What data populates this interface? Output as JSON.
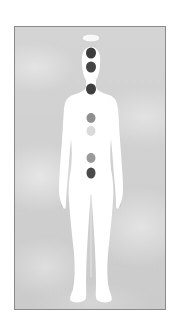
{
  "image": {
    "description": "Chakra diagram: white human silhouette on grey cloudy background with seven chakra points along the spine",
    "card_border_color": "#8a8a8a",
    "background_color": "#d0d0d0",
    "figure_color": "#ffffff"
  },
  "chakras": [
    {
      "name": "crown",
      "shape": "halo",
      "x": 76,
      "y": 11,
      "w": 18,
      "h": 8,
      "color": "#f8f8f8",
      "stroke": "#cfcfcf"
    },
    {
      "name": "third-eye",
      "shape": "dot",
      "x": 76,
      "y": 26,
      "w": 10,
      "h": 11,
      "color": "#3c3c3c"
    },
    {
      "name": "throat-upper",
      "shape": "dot",
      "x": 76,
      "y": 40,
      "w": 10,
      "h": 11,
      "color": "#444444"
    },
    {
      "name": "throat",
      "shape": "dot",
      "x": 76,
      "y": 62,
      "w": 10,
      "h": 11,
      "color": "#3e3e3e"
    },
    {
      "name": "heart",
      "shape": "dot",
      "x": 76,
      "y": 91,
      "w": 9,
      "h": 10,
      "color": "#8f8f8f"
    },
    {
      "name": "solar-plexus",
      "shape": "dot",
      "x": 76,
      "y": 104,
      "w": 9,
      "h": 10,
      "color": "#dadada"
    },
    {
      "name": "sacral",
      "shape": "dot",
      "x": 76,
      "y": 131,
      "w": 9,
      "h": 10,
      "color": "#9a9a9a"
    },
    {
      "name": "root",
      "shape": "dot",
      "x": 76,
      "y": 146,
      "w": 9,
      "h": 11,
      "color": "#4a4a4a"
    }
  ]
}
